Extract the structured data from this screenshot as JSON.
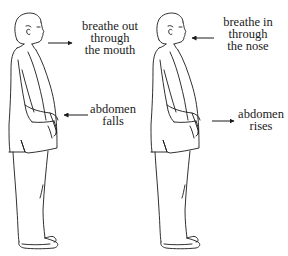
{
  "diagram": {
    "title": "",
    "figures": [
      {
        "id": "exhale",
        "labels": {
          "breath": [
            "breathe out",
            "through",
            "the mouth"
          ],
          "abdomen": [
            "abdomen",
            "falls"
          ]
        },
        "breath_arrow_direction": "away-from-mouth",
        "abdomen_arrow_direction": "toward-abdomen"
      },
      {
        "id": "inhale",
        "labels": {
          "breath": [
            "breathe in",
            "through",
            "the nose"
          ],
          "abdomen": [
            "abdomen",
            "rises"
          ]
        },
        "breath_arrow_direction": "toward-nose",
        "abdomen_arrow_direction": "away-from-abdomen"
      }
    ],
    "colors": {
      "line": "#1a1a1a",
      "background": "#ffffff"
    }
  }
}
